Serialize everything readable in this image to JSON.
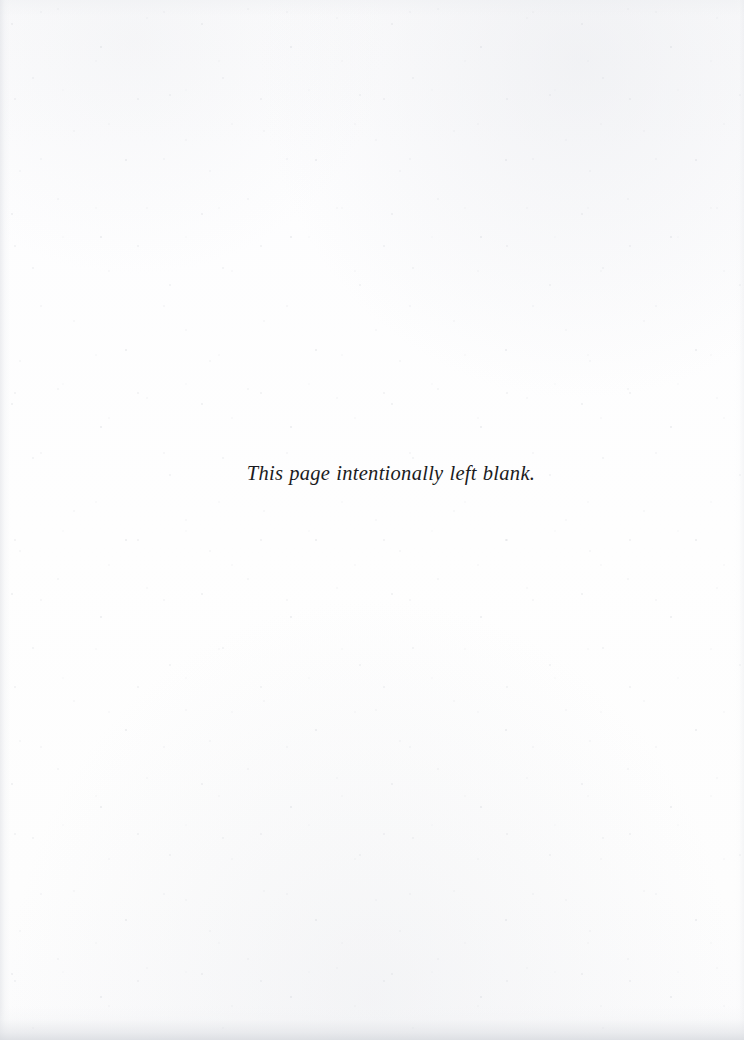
{
  "document": {
    "type": "scanned-book-page",
    "page_width": 744,
    "page_height": 1040,
    "notice": {
      "text": "This page intentionally left blank.",
      "style": "italic-serif",
      "alignment": "center",
      "color": "#1b1b21"
    },
    "background": {
      "paper_color": "#fdfdfd",
      "edge_shadow_color": "#d6d9de",
      "speckle_color": "#cdd0d6"
    },
    "page_number": "",
    "header": "",
    "footer": ""
  }
}
